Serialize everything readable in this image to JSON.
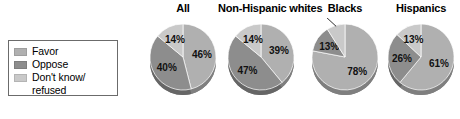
{
  "legend": {
    "items": [
      {
        "label": "Favor",
        "color": "#b0b0b0",
        "key": "favor"
      },
      {
        "label": "Oppose",
        "color": "#8d8d8d",
        "key": "oppose"
      },
      {
        "label": "Don't know/",
        "label_line2": "refused",
        "color": "#c9c9c9",
        "key": "dontknow"
      }
    ]
  },
  "chart_data": {
    "type": "pie",
    "title": "",
    "legend_position": "left",
    "categories": [
      "Favor",
      "Oppose",
      "Don't know/refused"
    ],
    "colors": [
      "#b0b0b0",
      "#8d8d8d",
      "#c9c9c9"
    ],
    "charts": [
      {
        "title": "All",
        "values": [
          46,
          40,
          14
        ],
        "labels": [
          "46%",
          "40%",
          "14%"
        ]
      },
      {
        "title": "Non-Hispanic whites",
        "values": [
          39,
          47,
          14
        ],
        "labels": [
          "39%",
          "47%",
          "14%"
        ]
      },
      {
        "title": "Blacks",
        "values": [
          78,
          13,
          9
        ],
        "labels": [
          "78%",
          "13%",
          "9%"
        ]
      },
      {
        "title": "Hispanics",
        "values": [
          61,
          26,
          13
        ],
        "labels": [
          "61%",
          "26%",
          "13%"
        ]
      }
    ]
  }
}
